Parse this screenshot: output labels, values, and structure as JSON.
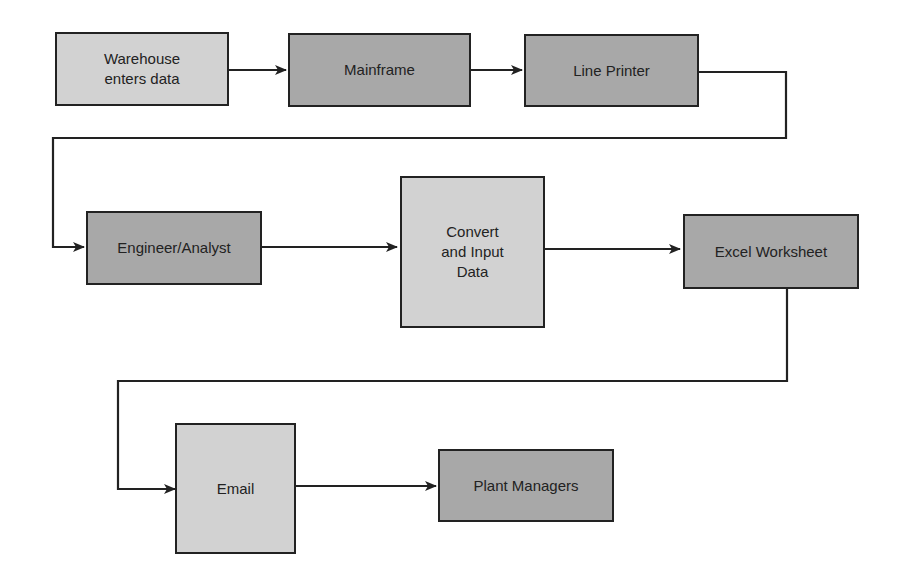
{
  "diagram": {
    "type": "flowchart",
    "colors": {
      "light_fill": "#d2d2d2",
      "dark_fill": "#a8a8a8",
      "stroke": "#222222",
      "background": "#ffffff"
    },
    "nodes": [
      {
        "id": "warehouse",
        "label": "Warehouse\nenters data",
        "shade": "light"
      },
      {
        "id": "mainframe",
        "label": "Mainframe",
        "shade": "dark"
      },
      {
        "id": "line_printer",
        "label": "Line Printer",
        "shade": "dark"
      },
      {
        "id": "engineer",
        "label": "Engineer/Analyst",
        "shade": "dark"
      },
      {
        "id": "convert",
        "label": "Convert\nand Input\nData",
        "shade": "light"
      },
      {
        "id": "excel",
        "label": "Excel Worksheet",
        "shade": "dark"
      },
      {
        "id": "email",
        "label": "Email",
        "shade": "light"
      },
      {
        "id": "plant_managers",
        "label": "Plant Managers",
        "shade": "dark"
      }
    ],
    "edges": [
      {
        "from": "warehouse",
        "to": "mainframe"
      },
      {
        "from": "mainframe",
        "to": "line_printer"
      },
      {
        "from": "line_printer",
        "to": "engineer"
      },
      {
        "from": "engineer",
        "to": "convert"
      },
      {
        "from": "convert",
        "to": "excel"
      },
      {
        "from": "excel",
        "to": "email"
      },
      {
        "from": "email",
        "to": "plant_managers"
      }
    ]
  }
}
